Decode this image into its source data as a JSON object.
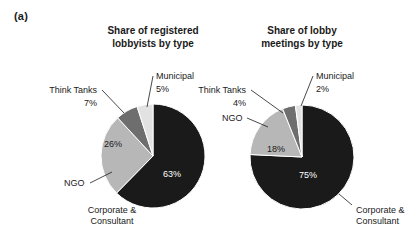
{
  "figure": {
    "panel_letter": "(a)"
  },
  "chart_data": [
    {
      "type": "pie",
      "id": "registered-lobbyists",
      "title": "Share of registered lobbyists by type",
      "title_lines": [
        "Share of registered",
        "lobbyists by type"
      ],
      "categories": [
        "Corporate & Consultant",
        "NGO",
        "Think Tanks",
        "Municipal"
      ],
      "values": [
        63,
        26,
        7,
        5
      ],
      "value_labels": [
        "63%",
        "26%",
        "7%",
        "5%"
      ],
      "colors": [
        "#1a1a1a",
        "#b7b7b7",
        "#6e6e6e",
        "#e2e2e2"
      ],
      "label_lines": [
        [
          "Corporate &",
          "Consultant"
        ],
        [
          "NGO"
        ],
        [
          "Think Tanks"
        ],
        [
          "Municipal"
        ]
      ],
      "start_angle_deg": 0,
      "direction": "clockwise",
      "legend": "callout-labels",
      "grid": false
    },
    {
      "type": "pie",
      "id": "lobby-meetings",
      "title": "Share of lobby meetings by type",
      "title_lines": [
        "Share of lobby",
        "meetings by type"
      ],
      "categories": [
        "Corporate & Consultant",
        "NGO",
        "Think Tanks",
        "Municipal"
      ],
      "values": [
        75,
        18,
        4,
        2
      ],
      "value_labels": [
        "75%",
        "18%",
        "4%",
        "2%"
      ],
      "colors": [
        "#1a1a1a",
        "#b7b7b7",
        "#6e6e6e",
        "#e2e2e2"
      ],
      "label_lines": [
        [
          "Corporate &",
          "Consultant"
        ],
        [
          "NGO"
        ],
        [
          "Think Tanks"
        ],
        [
          "Municipal"
        ]
      ],
      "start_angle_deg": 0,
      "direction": "clockwise",
      "legend": "callout-labels",
      "grid": false
    }
  ],
  "layout": {
    "pies": [
      {
        "cx": 153,
        "cy": 156,
        "r": 52
      },
      {
        "cx": 302,
        "cy": 157,
        "r": 52
      }
    ],
    "callouts_left": {
      "corporate": {
        "text_x": 112,
        "text_y": 213,
        "anchor": "middle",
        "line": "M 168,205 L 157,196"
      },
      "ngo": {
        "text_x": 64,
        "text_y": 186,
        "anchor": "start",
        "line": "M 90,183 L 112,172"
      },
      "think_tanks": {
        "text_x": 97,
        "text_y": 93,
        "anchor": "end",
        "line": "M 102,90 L 124,113"
      },
      "municipal": {
        "text_x": 156,
        "text_y": 79,
        "anchor": "start",
        "line": "M 153,76 L 146,108"
      }
    },
    "callouts_right": {
      "corporate": {
        "text_x": 356,
        "text_y": 213,
        "anchor": "start",
        "line": "M 352,205 L 339,194"
      },
      "ngo": {
        "text_x": 222,
        "text_y": 121,
        "anchor": "start",
        "line": "M 247,118 L 268,127"
      },
      "think_tanks": {
        "text_x": 246,
        "text_y": 93,
        "anchor": "end",
        "line": "M 251,90 L 283,113"
      },
      "municipal": {
        "text_x": 316,
        "text_y": 79,
        "anchor": "start",
        "line": "M 313,76 L 300,105"
      }
    },
    "inside_labels_left": {
      "corporate": {
        "x": 172,
        "y": 177
      },
      "ngo": {
        "x": 113,
        "y": 147
      }
    },
    "inside_labels_right": {
      "corporate": {
        "x": 308,
        "y": 178
      },
      "ngo": {
        "x": 276,
        "y": 152
      }
    }
  }
}
